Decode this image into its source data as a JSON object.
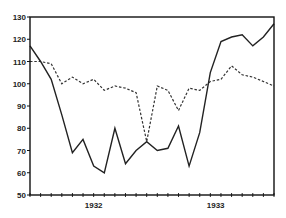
{
  "chart_data": {
    "type": "line",
    "title": "",
    "xlabel": "",
    "ylabel": "",
    "ylim": [
      50,
      130
    ],
    "yticks": [
      50,
      60,
      70,
      80,
      90,
      100,
      110,
      120,
      130
    ],
    "xtick_labels": [
      {
        "label": "1932",
        "month_index": 6
      },
      {
        "label": "1933",
        "month_index": 17.5
      }
    ],
    "grid": false,
    "legend": null,
    "x": [
      0,
      1,
      2,
      3,
      4,
      5,
      6,
      7,
      8,
      9,
      10,
      11,
      12,
      13,
      14,
      15,
      16,
      17,
      18,
      19,
      20,
      21,
      22,
      23
    ],
    "series": [
      {
        "name": "solid",
        "style": "solid",
        "color": "#222222",
        "values": [
          117,
          110,
          102,
          86,
          69,
          75,
          63,
          60,
          80,
          64,
          70,
          74,
          70,
          71,
          81,
          63,
          78,
          105,
          119,
          121,
          122,
          117,
          121,
          127
        ]
      },
      {
        "name": "dashed",
        "style": "dashed",
        "color": "#222222",
        "values": [
          110,
          110,
          109,
          100,
          103,
          100,
          102,
          97,
          99,
          98,
          96,
          74,
          99,
          97,
          88,
          98,
          97,
          101,
          102,
          108,
          104,
          103,
          101,
          99
        ]
      }
    ]
  },
  "frame": {
    "left": 30,
    "top": 17,
    "right": 274,
    "bottom": 195
  }
}
